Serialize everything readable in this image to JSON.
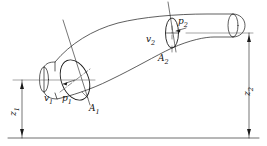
{
  "figure": {
    "type": "technical-line-drawing",
    "background_color": "#ffffff",
    "line_color": "#1a1a1a",
    "width": 267,
    "height": 146
  },
  "labels": {
    "velocity_inlet": "v",
    "velocity_inlet_sub": "1",
    "pressure_inlet": "p",
    "pressure_inlet_sub": "1",
    "area_inlet": "A",
    "area_inlet_sub": "1",
    "velocity_outlet": "v",
    "velocity_outlet_sub": "2",
    "pressure_outlet": "p",
    "pressure_outlet_sub": "2",
    "area_outlet": "A",
    "area_outlet_sub": "2",
    "height_inlet": "z",
    "height_inlet_sub": "1",
    "height_outlet": "z",
    "height_outlet_sub": "2"
  },
  "annotations": {
    "datum_line": "horizontal reference datum",
    "dimension_left": "vertical height dimension z1 from datum to inlet axis",
    "dimension_right": "vertical height dimension z2 from datum to outlet axis",
    "reference_line_left": "horizontal axis line through inlet section",
    "reference_line_right": "horizontal axis line through outlet section",
    "section_plane_inlet": "cutting plane line through inlet cross-section",
    "section_plane_outlet": "cutting plane line through outlet cross-section",
    "radius_arrow_inlet": "radius arrow inside inlet ellipse",
    "center_cross_outlet": "center cross marker inside outlet ellipse"
  }
}
